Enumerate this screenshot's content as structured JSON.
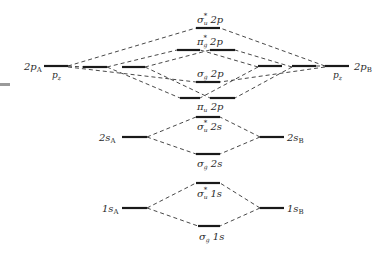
{
  "diagram": {
    "type": "molecular-orbital-energy-level-diagram",
    "colors": {
      "line": "#1a1a1a",
      "dash": "#333333",
      "text": "#2a2a2a",
      "side_mark": "#9a9a9a"
    },
    "atom_levels": {
      "left_2p": {
        "main": "2p",
        "sub": "A",
        "note": "p",
        "note_sub": "z"
      },
      "right_2p": {
        "main": "2p",
        "sub": "B",
        "note": "p",
        "note_sub": "z"
      },
      "left_2s": {
        "main": "2s",
        "sub": "A"
      },
      "right_2s": {
        "main": "2s",
        "sub": "B"
      },
      "left_1s": {
        "main": "1s",
        "sub": "A"
      },
      "right_1s": {
        "main": "1s",
        "sub": "B"
      }
    },
    "molecular_orbitals": {
      "sigma_u_star_2p": {
        "sym": "σ",
        "sub": "u",
        "sup": "*",
        "rest": " 2p"
      },
      "pi_g_star_2p": {
        "sym": "π",
        "sub": "g",
        "sup": "*",
        "rest": " 2p"
      },
      "sigma_g_2p": {
        "sym": "σ",
        "sub": "g",
        "sup": "",
        "rest": " 2p"
      },
      "pi_u_2p": {
        "sym": "π",
        "sub": "u",
        "sup": "",
        "rest": " 2p"
      },
      "sigma_u_star_2s": {
        "sym": "σ",
        "sub": "u",
        "sup": "*",
        "rest": " 2s"
      },
      "sigma_g_2s": {
        "sym": "σ",
        "sub": "g",
        "sup": "",
        "rest": " 2s"
      },
      "sigma_u_star_1s": {
        "sym": "σ",
        "sub": "u",
        "sup": "*",
        "rest": " 1s"
      },
      "sigma_g_1s": {
        "sym": "σ",
        "sub": "g",
        "sup": "",
        "rest": " 1s"
      }
    }
  }
}
